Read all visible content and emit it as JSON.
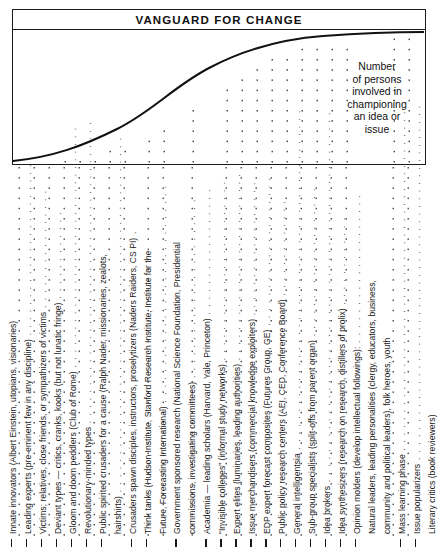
{
  "chart": {
    "title": "VANGUARD FOR CHANGE",
    "annotation_lines": [
      "Number",
      "of persons",
      "involved in",
      "championing",
      "an idea or",
      "issue"
    ]
  },
  "chart_data": {
    "type": "area",
    "title": "VANGUARD FOR CHANGE",
    "xlabel": "",
    "ylabel": "Number of persons involved in championing an idea or issue",
    "grid": false,
    "legend": null,
    "curve_shape": "s-curve (logistic diffusion curve)",
    "x": [
      0,
      5,
      10,
      15,
      20,
      25,
      30,
      35,
      40,
      45,
      50,
      55,
      60,
      65,
      70,
      75,
      80,
      85,
      90,
      95,
      100
    ],
    "y": [
      1,
      2,
      4,
      6,
      9,
      12,
      16,
      21,
      27,
      34,
      43,
      53,
      62,
      71,
      79,
      86,
      91,
      94,
      96,
      97,
      98
    ],
    "ylim": [
      0,
      100
    ],
    "xlim": [
      0,
      100
    ],
    "categories": [
      "Innate innovators",
      "Leading experts",
      "Victims",
      "Deviant types",
      "Gloom and doom peddlers",
      "Revolutionary-minded types",
      "Public spirited crusaders",
      "Crusaders spawn disciples",
      "Think tanks",
      "Government sponsored research",
      "Academia",
      "“Invisible colleges”",
      "Expert elites",
      "Issue merchandisers",
      "EDP expert forecast composites",
      "Public policy research centers",
      "General intelligentsia",
      "Sub-group specialists",
      "Idea brokers",
      "Idea synthesizers",
      "Opinion molders",
      "Mass learning phase",
      "Issue popularizers"
    ]
  },
  "labels": [
    {
      "id": "innate-innovators",
      "tick": true,
      "text": "Innate innovators (Albert Einstein, utopians, visionaries)",
      "leader": ""
    },
    {
      "id": "leading-experts",
      "tick": true,
      "text": "Leading experts (pre-eminent few in any discipline)",
      "leader": " . . . . . . . . . . . . . . . . . . . . . . . ."
    },
    {
      "id": "victims",
      "tick": true,
      "text": "Victims; relatives, close friends, or sympathizers of victims",
      "leader": " . . . . . . . . . . . . . . . ."
    },
    {
      "id": "deviant-types",
      "tick": true,
      "text": "Deviant types — critics, cranks, kooks (but not lunatic fringe)",
      "leader": " . . . . . . . . . . . ."
    },
    {
      "id": "gloom-and-doom-peddlers",
      "tick": true,
      "text": "Gloom and doom peddlers (Club of Rome)",
      "leader": " . . . . . . . . . . . . . . . . . . . . . . . . . . . . . . . ."
    },
    {
      "id": "revolutionary-minded-types",
      "tick": true,
      "text": "Revolutionary-minded types",
      "leader": " . . . . . . . . . . . . . . . . . . . . . . . . . . . . . . . . . . . . . . . ."
    },
    {
      "id": "public-spirited-crusaders",
      "tick": true,
      "text": "Public spirited crusaders for a cause (Ralph Nader, missionaries, zealots,",
      "leader": ""
    },
    {
      "id": "public-spirited-crusaders-cont",
      "tick": false,
      "text": "hairshirts)",
      "leader": " . . . . . . . . . . . . . . . . . . . . . . . . . . . . . . . . . . . . . . . . . . . . . . ."
    },
    {
      "id": "crusaders-spawn-disciples",
      "tick": true,
      "text": "Crusaders spawn disciples, instructors, proselytizers (Naders Raiders, CS PI)",
      "leader": " ."
    },
    {
      "id": "think-tanks",
      "tick": true,
      "text": "Think tanks (Hudson Institute, Stanford Research Institute, Institute for the",
      "leader": ""
    },
    {
      "id": "think-tanks-cont",
      "tick": false,
      "text": "Future, Forecasting International)",
      "leader": " . . . . . . . . . . . . . . . . . . . . . . . . . . . . ."
    },
    {
      "id": "government-sponsored-research",
      "tick": true,
      "text": "Government sponsored research (National Science Foundation, Presidential",
      "leader": ""
    },
    {
      "id": "government-sponsored-research-cont",
      "tick": false,
      "text": "commissions, investigating committees)",
      "leader": " . . . . . . . . . . . . . . . . . . . . . . . ."
    },
    {
      "id": "academia",
      "tick": true,
      "text": "Academia — leading scholars (Harvard, Yale, Princeton)",
      "leader": " . . . . . . . . . . . . . . . . ."
    },
    {
      "id": "invisible-colleges",
      "tick": true,
      "text": "“Invisible colleges” (informal study networks)",
      "leader": " . . . . . . . . . . . . . . . . . . . . . . . ."
    },
    {
      "id": "expert-elites",
      "tick": true,
      "text": "Expert elites (luminaries, leading authorities)",
      "leader": " . . . . . . . . . . . . . . . . . . . . . . . . ."
    },
    {
      "id": "issue-merchandisers",
      "tick": true,
      "text": "Issue merchandisers (commercial knowledge exploiters)",
      "leader": " . . . . . . . . . . . . . . . . . ."
    },
    {
      "id": "edp-expert-forecast-composites",
      "tick": true,
      "text": "EDP expert forecast composites (Futures Group, GE)",
      "leader": " . . . . . . . . . . . . . . . . . . . ."
    },
    {
      "id": "public-policy-research-centers",
      "tick": true,
      "text": "Public policy research centers (AEI, CED, Conference Board)",
      "leader": " . . . . . . . . . . . . ."
    },
    {
      "id": "general-intelligentsia",
      "tick": true,
      "text": "General intelligentsia",
      "leader": " . . . . . . . . . . . . . . . . . . . . . . . . . . . . . . . . . . . . . . . . . . . . ."
    },
    {
      "id": "sub-group-specialists",
      "tick": true,
      "text": "Sub-group specialists (split-offs from parent organ)",
      "leader": " . . . . . . . . . . . . . . . . . . . ."
    },
    {
      "id": "idea-brokers",
      "tick": true,
      "text": "Idea brokers",
      "leader": " . . . . . . . . . . . . . . . . . . . . . . . . . . . . . . . . . . . . . . . . . . . . . . . . ."
    },
    {
      "id": "idea-synthesizers",
      "tick": true,
      "text": "Idea synthesizers (research on research, distillers of prolix)",
      "leader": " . . . . . . . . . . . ."
    },
    {
      "id": "opinion-molders",
      "tick": true,
      "text": "Opinion molders (develop intellectual followings):",
      "leader": " . . . . . . . . . . . . . . . . . . . ."
    },
    {
      "id": "natural-leaders",
      "tick": false,
      "text": "Natural leaders, leading personalities (clergy, educators, business,",
      "leader": ""
    },
    {
      "id": "natural-leaders-cont",
      "tick": false,
      "text": "community and political leaders), folk heroes, youth",
      "leader": ""
    },
    {
      "id": "mass-learning-phase",
      "tick": true,
      "text": "Mass learning phase",
      "leader": " . . . . . . . . . . . . . . . . . . . . . . . . . . . . . . . . . . . . . . . . . . . . ."
    },
    {
      "id": "issue-popularizers",
      "tick": true,
      "text": "Issue popularizers",
      "leader": " . . . . . . . . . . . . . . . . . . . . . . . . . . . . . . . . . . . . . . . . . . . . . . ."
    },
    {
      "id": "literary-critics",
      "tick": false,
      "text": "Literary critics (book reviewers)",
      "leader": ""
    },
    {
      "id": "popular-wisdom-peddlers",
      "tick": false,
      "text": "Popular wisdom peddlers (cabbies, barbers)",
      "leader": ""
    }
  ],
  "colors": {
    "ink": "#1a1a1a",
    "background": "#ffffff",
    "curve": "#111111",
    "dots": "#555555"
  }
}
